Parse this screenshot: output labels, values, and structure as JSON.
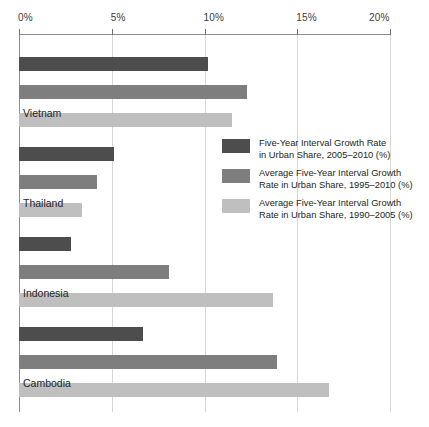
{
  "chart_data": {
    "type": "bar",
    "orientation": "horizontal",
    "title": "",
    "xlabel": "",
    "ylabel": "",
    "xlim": [
      0,
      20
    ],
    "xticks": [
      0,
      5,
      10,
      15,
      20
    ],
    "xtick_labels": [
      "0%",
      "5%",
      "10%",
      "15%",
      "20%"
    ],
    "grid": true,
    "legend_position": "center-right",
    "categories": [
      "Vietnam",
      "Thailand",
      "Indonesia",
      "Cambodia"
    ],
    "series": [
      {
        "name": "Five-Year Interval Growth Rate in Urban Share, 2005–2010 (%)",
        "color": "#4d4d4d",
        "values": [
          10.2,
          5.1,
          2.8,
          6.7
        ]
      },
      {
        "name": "Average Five-Year Interval Growth Rate in Urban Share, 1995–2010 (%)",
        "color": "#7e7e7e",
        "values": [
          12.3,
          4.2,
          8.1,
          13.9
        ]
      },
      {
        "name": "Average Five-Year Interval Growth Rate in Urban Share, 1990–2005 (%)",
        "color": "#bfbfbf",
        "values": [
          11.5,
          3.4,
          13.7,
          16.7
        ]
      }
    ]
  },
  "axis": {
    "ticks": [
      {
        "label": "0%",
        "value": 0
      },
      {
        "label": "5%",
        "value": 5
      },
      {
        "label": "10%",
        "value": 10
      },
      {
        "label": "15%",
        "value": 15
      },
      {
        "label": "20%",
        "value": 20
      }
    ]
  },
  "groups": [
    {
      "label": "Vietnam",
      "bars": [
        {
          "series": "Five-Year Interval Growth Rate in Urban Share, 2005–2010 (%)",
          "value": 10.2,
          "color": "#4d4d4d"
        },
        {
          "series": "Average Five-Year Interval Growth Rate in Urban Share, 1995–2010 (%)",
          "value": 12.3,
          "color": "#7e7e7e"
        },
        {
          "series": "Average Five-Year Interval Growth Rate in Urban Share, 1990–2005 (%)",
          "value": 11.5,
          "color": "#bfbfbf"
        }
      ]
    },
    {
      "label": "Thailand",
      "bars": [
        {
          "series": "Five-Year Interval Growth Rate in Urban Share, 2005–2010 (%)",
          "value": 5.1,
          "color": "#4d4d4d"
        },
        {
          "series": "Average Five-Year Interval Growth Rate in Urban Share, 1995–2010 (%)",
          "value": 4.2,
          "color": "#7e7e7e"
        },
        {
          "series": "Average Five-Year Interval Growth Rate in Urban Share, 1990–2005 (%)",
          "value": 3.4,
          "color": "#bfbfbf"
        }
      ]
    },
    {
      "label": "Indonesia",
      "bars": [
        {
          "series": "Five-Year Interval Growth Rate in Urban Share, 2005–2010 (%)",
          "value": 2.8,
          "color": "#4d4d4d"
        },
        {
          "series": "Average Five-Year Interval Growth Rate in Urban Share, 1995–2010 (%)",
          "value": 8.1,
          "color": "#7e7e7e"
        },
        {
          "series": "Average Five-Year Interval Growth Rate in Urban Share, 1990–2005 (%)",
          "value": 13.7,
          "color": "#bfbfbf"
        }
      ]
    },
    {
      "label": "Cambodia",
      "bars": [
        {
          "series": "Five-Year Interval Growth Rate in Urban Share, 2005–2010 (%)",
          "value": 6.7,
          "color": "#4d4d4d"
        },
        {
          "series": "Average Five-Year Interval Growth Rate in Urban Share, 1995–2010 (%)",
          "value": 13.9,
          "color": "#7e7e7e"
        },
        {
          "series": "Average Five-Year Interval Growth Rate in Urban Share, 1990–2005 (%)",
          "value": 16.7,
          "color": "#bfbfbf"
        }
      ]
    }
  ],
  "legend": {
    "items": [
      {
        "color": "#4d4d4d",
        "text": "Five-Year Interval Growth Rate\nin Urban Share, 2005–2010 (%)"
      },
      {
        "color": "#7e7e7e",
        "text": "Average Five-Year Interval Growth\nRate in Urban Share, 1995–2010 (%)"
      },
      {
        "color": "#bfbfbf",
        "text": "Average Five-Year Interval Growth\nRate in Urban Share, 1990–2005 (%)"
      }
    ]
  },
  "colors": {
    "series_dark": "#4d4d4d",
    "series_medium": "#7e7e7e",
    "series_light": "#bfbfbf",
    "gridline": "#d6d6d6",
    "axis": "#8d8d8d",
    "text": "#231f20"
  }
}
